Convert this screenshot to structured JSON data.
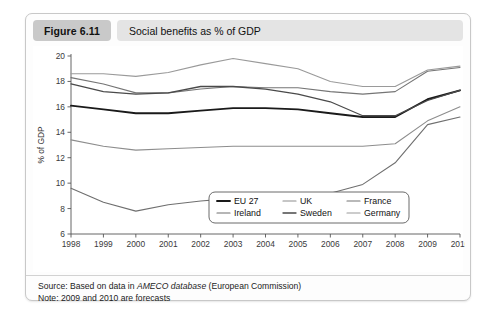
{
  "figure": {
    "badge": "Figure 6.11",
    "title": "Social benefits as % of GDP"
  },
  "footer": {
    "source_prefix": "Source: Based on data in ",
    "source_italic": "AMECO database",
    "source_suffix": " (European Commission)",
    "note": "Note: 2009 and 2010 are forecasts"
  },
  "chart_data": {
    "type": "line",
    "title": "Social benefits as % of GDP",
    "xlabel": "",
    "ylabel": "% of GDP",
    "xlim": [
      1998,
      2010
    ],
    "ylim": [
      6,
      20
    ],
    "yticks": [
      6,
      8,
      10,
      12,
      14,
      16,
      18,
      20
    ],
    "grid": false,
    "legend_position": "bottom-center",
    "categories": [
      1998,
      1999,
      2000,
      2001,
      2002,
      2003,
      2004,
      2005,
      2006,
      2007,
      2008,
      2009,
      2010
    ],
    "x": [
      "1998",
      "1999",
      "2000",
      "2001",
      "2002",
      "2003",
      "2004",
      "2005",
      "2006",
      "2007",
      "2008",
      "2009",
      "2010"
    ],
    "series": [
      {
        "name": "EU 27",
        "color": "#1a1a1a",
        "width": 1.9,
        "values": [
          16.1,
          15.8,
          15.5,
          15.5,
          15.7,
          15.9,
          15.9,
          15.8,
          15.5,
          15.2,
          15.2,
          16.6,
          17.3
        ]
      },
      {
        "name": "UK",
        "color": "#8d8d8d",
        "width": 1.1,
        "values": [
          13.4,
          12.9,
          12.6,
          12.7,
          12.8,
          12.9,
          12.9,
          12.9,
          12.9,
          12.9,
          13.1,
          14.9,
          16.0
        ]
      },
      {
        "name": "France",
        "color": "#757575",
        "width": 1.1,
        "values": [
          18.3,
          17.8,
          17.1,
          17.1,
          17.4,
          17.6,
          17.5,
          17.5,
          17.2,
          17.0,
          17.2,
          18.8,
          19.1
        ]
      },
      {
        "name": "Ireland",
        "color": "#6f6f6f",
        "width": 1.1,
        "values": [
          9.6,
          8.5,
          7.8,
          8.3,
          8.6,
          8.8,
          8.8,
          9.0,
          9.2,
          9.9,
          11.6,
          14.6,
          15.2
        ]
      },
      {
        "name": "Sweden",
        "color": "#4a4a4a",
        "width": 1.3,
        "values": [
          17.8,
          17.2,
          17.0,
          17.1,
          17.6,
          17.6,
          17.4,
          17.0,
          16.4,
          15.3,
          15.3,
          16.5,
          17.3
        ]
      },
      {
        "name": "Germany",
        "color": "#9a9a9a",
        "width": 1.1,
        "values": [
          18.6,
          18.6,
          18.4,
          18.7,
          19.3,
          19.8,
          19.4,
          19.0,
          18.0,
          17.6,
          17.6,
          18.9,
          19.2
        ]
      }
    ]
  }
}
